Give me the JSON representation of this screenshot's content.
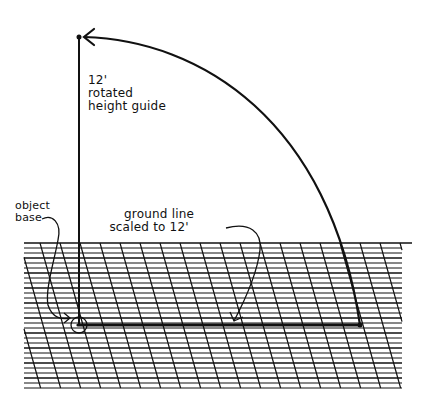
{
  "diagram": {
    "type": "perspective height-guide sketch",
    "labels": {
      "height_guide": [
        "12'",
        "rotated",
        "height guide"
      ],
      "object_base": [
        "object",
        "base"
      ],
      "ground_line": [
        "ground line",
        "scaled to 12'"
      ]
    },
    "colors": {
      "ink": "#111111",
      "background": "#ffffff"
    }
  }
}
